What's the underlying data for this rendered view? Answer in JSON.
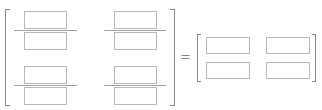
{
  "diagram": {
    "colors": {
      "box_border": "#b8b8b8",
      "line": "#a0a0a0",
      "bracket": "#8a8a8a",
      "background": "#ffffff"
    },
    "left_matrix": {
      "rows": 2,
      "cols": 2,
      "fractions": [
        {
          "row": 1,
          "col": 1,
          "numerator": "",
          "denominator": ""
        },
        {
          "row": 1,
          "col": 2,
          "numerator": "",
          "denominator": ""
        },
        {
          "row": 2,
          "col": 1,
          "numerator": "",
          "denominator": ""
        },
        {
          "row": 2,
          "col": 2,
          "numerator": "",
          "denominator": ""
        }
      ]
    },
    "operator": "=",
    "right_matrix": {
      "rows": 2,
      "cols": 2,
      "cells": [
        {
          "row": 1,
          "col": 1,
          "value": ""
        },
        {
          "row": 1,
          "col": 2,
          "value": ""
        },
        {
          "row": 2,
          "col": 1,
          "value": ""
        },
        {
          "row": 2,
          "col": 2,
          "value": ""
        }
      ]
    }
  }
}
